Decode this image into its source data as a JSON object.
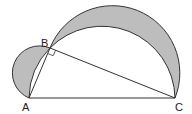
{
  "diagram": {
    "points": {
      "A": {
        "label": "A",
        "x": 29,
        "y": 98
      },
      "B": {
        "label": "B",
        "x": 50,
        "y": 48
      },
      "C": {
        "label": "C",
        "x": 175,
        "y": 98
      }
    },
    "right_angle_at": "B",
    "colors": {
      "shade": "#bdbdbd",
      "stroke": "#333333"
    }
  }
}
